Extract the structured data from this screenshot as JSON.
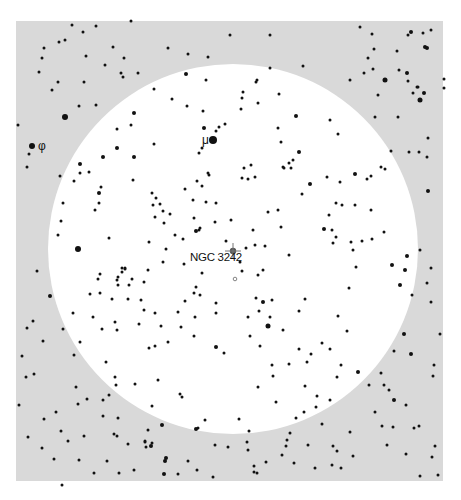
{
  "map": {
    "type": "finder-chart",
    "background_color": "#ffffff",
    "field_color": "#d9d9d9",
    "field_rect": {
      "x": 16,
      "y": 21,
      "w": 427,
      "h": 460
    },
    "fov_circle": {
      "cx": 233,
      "cy": 249,
      "r": 185,
      "color": "#ffffff"
    },
    "target": {
      "name": "NGC 3242",
      "x": 233,
      "y": 251,
      "label_x": 190,
      "label_y": 261
    },
    "labels": [
      {
        "text": "μ",
        "x": 202,
        "y": 144,
        "star_x": 213,
        "star_y": 140
      },
      {
        "text": "φ",
        "x": 38,
        "y": 150,
        "star_x": 32,
        "star_y": 146
      }
    ],
    "open_marker": {
      "x": 235,
      "y": 279
    }
  },
  "stars": [
    [
      213,
      140,
      4
    ],
    [
      32,
      146,
      3
    ],
    [
      78,
      249,
      3
    ],
    [
      233,
      251,
      0
    ],
    [
      121,
      73,
      1.5
    ],
    [
      138,
      73,
      1.5
    ],
    [
      58,
      82,
      1.5
    ],
    [
      84,
      82,
      1.5
    ],
    [
      105,
      65,
      1.5
    ],
    [
      65,
      117,
      3
    ],
    [
      79,
      106,
      1.5
    ],
    [
      96,
      105,
      1.5
    ],
    [
      131,
      125,
      1.5
    ],
    [
      18,
      125,
      1.5
    ],
    [
      29,
      154,
      1.5
    ],
    [
      27,
      167,
      1.5
    ],
    [
      60,
      176,
      1.5
    ],
    [
      80,
      173,
      1.5
    ],
    [
      123,
      77,
      1.5
    ],
    [
      168,
      48,
      1.5
    ],
    [
      188,
      54,
      1.5
    ],
    [
      208,
      57,
      1.5
    ],
    [
      186,
      74,
      2
    ],
    [
      206,
      80,
      1.5
    ],
    [
      154,
      89,
      1.5
    ],
    [
      172,
      99,
      1.5
    ],
    [
      187,
      106,
      1.5
    ],
    [
      203,
      111,
      1.5
    ],
    [
      202,
      148,
      1.5
    ],
    [
      199,
      153,
      1.5
    ],
    [
      216,
      131,
      1.5
    ],
    [
      204,
      128,
      2
    ],
    [
      219,
      127,
      1.5
    ],
    [
      225,
      124,
      1.5
    ],
    [
      134,
      113,
      2
    ],
    [
      117,
      129,
      1.5
    ],
    [
      154,
      144,
      1.5
    ],
    [
      117,
      148,
      2
    ],
    [
      134,
      157,
      2
    ],
    [
      103,
      157,
      2
    ],
    [
      80,
      164,
      2
    ],
    [
      89,
      172,
      1.5
    ],
    [
      74,
      181,
      1.5
    ],
    [
      101,
      187,
      1.5
    ],
    [
      99,
      193,
      2
    ],
    [
      95,
      210,
      1.5
    ],
    [
      99,
      203,
      1.5
    ],
    [
      133,
      180,
      1.5
    ],
    [
      152,
      193,
      1.5
    ],
    [
      153,
      205,
      1.5
    ],
    [
      156,
      198,
      1.5
    ],
    [
      160,
      204,
      1.5
    ],
    [
      185,
      189,
      1.5
    ],
    [
      193,
      200,
      1.5
    ],
    [
      197,
      181,
      1.5
    ],
    [
      208,
      173,
      1.5
    ],
    [
      209,
      175,
      1.5
    ],
    [
      243,
      92,
      1.5
    ],
    [
      257,
      80,
      1.5
    ],
    [
      256,
      82,
      1.5
    ],
    [
      242,
      98,
      1.5
    ],
    [
      279,
      94,
      1.5
    ],
    [
      303,
      66,
      1.5
    ],
    [
      270,
      68,
      1.5
    ],
    [
      296,
      116,
      2
    ],
    [
      241,
      109,
      1.5
    ],
    [
      258,
      103,
      1.5
    ],
    [
      278,
      128,
      1.5
    ],
    [
      299,
      152,
      2
    ],
    [
      330,
      120,
      1.5
    ],
    [
      338,
      134,
      1.5
    ],
    [
      281,
      142,
      1.5
    ],
    [
      293,
      160,
      1.5
    ],
    [
      283,
      167,
      1.5
    ],
    [
      284,
      168,
      1.5
    ],
    [
      291,
      168,
      1.5
    ],
    [
      251,
      165,
      1.5
    ],
    [
      255,
      177,
      1.5
    ],
    [
      248,
      179,
      1.5
    ],
    [
      244,
      168,
      1.5
    ],
    [
      242,
      178,
      1.5
    ],
    [
      289,
      163,
      1.5
    ],
    [
      310,
      184,
      2
    ],
    [
      327,
      177,
      1.5
    ],
    [
      340,
      182,
      1.5
    ],
    [
      302,
      194,
      1.5
    ],
    [
      336,
      203,
      1.5
    ],
    [
      342,
      205,
      1.5
    ],
    [
      355,
      174,
      2
    ],
    [
      355,
      205,
      1.5
    ],
    [
      367,
      179,
      1.5
    ],
    [
      371,
      210,
      1.5
    ],
    [
      371,
      176,
      1.5
    ],
    [
      385,
      80,
      2.5
    ],
    [
      350,
      80,
      1.5
    ],
    [
      364,
      73,
      1.5
    ],
    [
      399,
      70,
      1.5
    ],
    [
      407,
      73,
      2
    ],
    [
      408,
      81,
      1.5
    ],
    [
      413,
      93,
      1.5
    ],
    [
      417,
      87,
      1.5
    ],
    [
      420,
      100,
      2.5
    ],
    [
      418,
      87,
      1.5
    ],
    [
      424,
      93,
      2
    ],
    [
      444,
      88,
      1.5
    ],
    [
      444,
      79,
      1.5
    ],
    [
      398,
      117,
      1.5
    ],
    [
      378,
      95,
      1.5
    ],
    [
      375,
      117,
      1.5
    ],
    [
      391,
      151,
      1.5
    ],
    [
      409,
      152,
      1.5
    ],
    [
      419,
      152,
      1.5
    ],
    [
      427,
      157,
      1.5
    ],
    [
      428,
      191,
      2
    ],
    [
      385,
      169,
      1.5
    ],
    [
      381,
      167,
      1.5
    ],
    [
      270,
      35,
      1.5
    ],
    [
      230,
      35,
      1.5
    ],
    [
      360,
      27,
      1.5
    ],
    [
      411,
      32,
      2
    ],
    [
      408,
      35,
      1.5
    ],
    [
      425,
      47,
      2
    ],
    [
      427,
      48,
      2
    ],
    [
      423,
      33,
      1.5
    ],
    [
      372,
      34,
      1.5
    ],
    [
      131,
      21,
      1.5
    ],
    [
      96,
      26,
      1.5
    ],
    [
      83,
      32,
      1.5
    ],
    [
      65,
      40,
      1.5
    ],
    [
      59,
      42,
      1.5
    ],
    [
      44,
      48,
      1.5
    ],
    [
      86,
      56,
      1.5
    ],
    [
      124,
      58,
      1.5
    ],
    [
      113,
      47,
      1.5
    ],
    [
      72,
      25,
      1.5
    ],
    [
      42,
      58,
      1.5
    ],
    [
      374,
      49,
      1.5
    ],
    [
      397,
      51,
      1.5
    ],
    [
      431,
      30,
      1.5
    ],
    [
      368,
      58,
      1.5
    ],
    [
      373,
      69,
      1.5
    ],
    [
      39,
      72,
      1.5
    ],
    [
      52,
      90,
      1.5
    ],
    [
      428,
      138,
      1.5
    ],
    [
      196,
      231,
      2
    ],
    [
      200,
      228,
      1.5
    ],
    [
      215,
      222,
      1.5
    ],
    [
      242,
      271,
      1.5
    ],
    [
      265,
      246,
      1.5
    ],
    [
      255,
      245,
      1.5
    ],
    [
      246,
      248,
      1.5
    ],
    [
      268,
      212,
      1.5
    ],
    [
      278,
      210,
      1.5
    ],
    [
      289,
      255,
      1.5
    ],
    [
      281,
      227,
      1.5
    ],
    [
      258,
      275,
      1.5
    ],
    [
      263,
      270,
      1.5
    ],
    [
      240,
      262,
      1.5
    ],
    [
      226,
      241,
      1.5
    ],
    [
      216,
      203,
      1.5
    ],
    [
      206,
      202,
      1.5
    ],
    [
      202,
      186,
      1.5
    ],
    [
      163,
      211,
      1.5
    ],
    [
      170,
      214,
      1.5
    ],
    [
      184,
      264,
      1.5
    ],
    [
      163,
      262,
      1.5
    ],
    [
      125,
      268,
      1.5
    ],
    [
      148,
      270,
      1.5
    ],
    [
      149,
      242,
      1.5
    ],
    [
      155,
      217,
      1.5
    ],
    [
      164,
      223,
      1.5
    ],
    [
      175,
      235,
      1.5
    ],
    [
      166,
      249,
      1.5
    ],
    [
      183,
      239,
      1.5
    ],
    [
      199,
      230,
      1.5
    ],
    [
      202,
      273,
      1.5
    ],
    [
      194,
      218,
      1.5
    ],
    [
      231,
      220,
      1.5
    ],
    [
      253,
      230,
      1.5
    ],
    [
      324,
      229,
      2
    ],
    [
      332,
      230,
      1.5
    ],
    [
      336,
      237,
      1.5
    ],
    [
      329,
      215,
      1.5
    ],
    [
      333,
      243,
      1.5
    ],
    [
      351,
      242,
      1.5
    ],
    [
      353,
      250,
      1.5
    ],
    [
      362,
      241,
      1.5
    ],
    [
      372,
      239,
      1.5
    ],
    [
      356,
      267,
      1.5
    ],
    [
      384,
      232,
      1.5
    ],
    [
      392,
      265,
      2
    ],
    [
      420,
      250,
      1.5
    ],
    [
      407,
      256,
      2
    ],
    [
      405,
      270,
      2
    ],
    [
      400,
      285,
      2
    ],
    [
      412,
      295,
      1.5
    ],
    [
      431,
      268,
      1.5
    ],
    [
      427,
      283,
      1.5
    ],
    [
      431,
      302,
      1.5
    ],
    [
      63,
      203,
      1.5
    ],
    [
      61,
      221,
      1.5
    ],
    [
      58,
      235,
      1.5
    ],
    [
      109,
      238,
      1.5
    ],
    [
      100,
      274,
      1.5
    ],
    [
      98,
      279,
      1.5
    ],
    [
      118,
      277,
      1.5
    ],
    [
      122,
      268,
      1.5
    ],
    [
      125,
      269,
      1.5
    ],
    [
      117,
      280,
      1.5
    ],
    [
      118,
      285,
      1.5
    ],
    [
      129,
      285,
      1.5
    ],
    [
      132,
      279,
      1.5
    ],
    [
      141,
      300,
      1.5
    ],
    [
      144,
      282,
      1.5
    ],
    [
      144,
      310,
      1.5
    ],
    [
      115,
      322,
      1.5
    ],
    [
      117,
      330,
      1.5
    ],
    [
      93,
      317,
      1.5
    ],
    [
      102,
      329,
      1.5
    ],
    [
      100,
      293,
      1.5
    ],
    [
      112,
      299,
      1.5
    ],
    [
      90,
      294,
      1.5
    ],
    [
      122,
      272,
      1.5
    ],
    [
      128,
      299,
      1.5
    ],
    [
      139,
      324,
      1.5
    ],
    [
      155,
      313,
      1.5
    ],
    [
      161,
      326,
      1.5
    ],
    [
      155,
      346,
      1.5
    ],
    [
      168,
      342,
      1.5
    ],
    [
      178,
      312,
      1.5
    ],
    [
      181,
      327,
      1.5
    ],
    [
      194,
      336,
      1.5
    ],
    [
      195,
      317,
      1.5
    ],
    [
      216,
      303,
      1.5
    ],
    [
      216,
      313,
      1.5
    ],
    [
      216,
      347,
      2
    ],
    [
      224,
      353,
      1.5
    ],
    [
      196,
      287,
      1.5
    ],
    [
      200,
      295,
      1.5
    ],
    [
      185,
      301,
      1.5
    ],
    [
      194,
      293,
      1.5
    ],
    [
      256,
      298,
      1.5
    ],
    [
      259,
      311,
      1.5
    ],
    [
      270,
      317,
      1.5
    ],
    [
      272,
      300,
      1.5
    ],
    [
      263,
      302,
      2
    ],
    [
      268,
      326,
      2.5
    ],
    [
      248,
      317,
      1.5
    ],
    [
      250,
      336,
      1.5
    ],
    [
      283,
      330,
      1.5
    ],
    [
      305,
      299,
      1.5
    ],
    [
      299,
      311,
      1.5
    ],
    [
      349,
      288,
      1.5
    ],
    [
      338,
      316,
      1.5
    ],
    [
      347,
      331,
      1.5
    ],
    [
      322,
      343,
      1.5
    ],
    [
      330,
      349,
      1.5
    ],
    [
      299,
      349,
      1.5
    ],
    [
      307,
      362,
      1.5
    ],
    [
      311,
      354,
      1.5
    ],
    [
      260,
      346,
      1.5
    ],
    [
      272,
      365,
      1.5
    ],
    [
      289,
      364,
      1.5
    ],
    [
      341,
      365,
      1.5
    ],
    [
      358,
      372,
      2
    ],
    [
      369,
      385,
      1.5
    ],
    [
      50,
      296,
      2
    ],
    [
      43,
      341,
      1.5
    ],
    [
      33,
      321,
      1.5
    ],
    [
      37,
      271,
      1.5
    ],
    [
      27,
      328,
      1.5
    ],
    [
      63,
      329,
      1.5
    ],
    [
      73,
      313,
      1.5
    ],
    [
      80,
      342,
      1.5
    ],
    [
      22,
      356,
      1.5
    ],
    [
      34,
      374,
      1.5
    ],
    [
      19,
      405,
      1.5
    ],
    [
      28,
      437,
      1.5
    ],
    [
      44,
      419,
      1.5
    ],
    [
      56,
      412,
      1.5
    ],
    [
      61,
      431,
      1.5
    ],
    [
      76,
      387,
      1.5
    ],
    [
      78,
      404,
      1.5
    ],
    [
      26,
      377,
      1.5
    ],
    [
      394,
      351,
      1.5
    ],
    [
      381,
      373,
      1.5
    ],
    [
      384,
      385,
      1.5
    ],
    [
      389,
      390,
      1.5
    ],
    [
      394,
      400,
      2
    ],
    [
      375,
      412,
      1.5
    ],
    [
      406,
      405,
      1.5
    ],
    [
      419,
      426,
      1.5
    ],
    [
      414,
      428,
      1.5
    ],
    [
      382,
      426,
      1.5
    ],
    [
      387,
      445,
      1.5
    ],
    [
      406,
      454,
      1.5
    ],
    [
      432,
      457,
      1.5
    ],
    [
      420,
      476,
      1.5
    ],
    [
      438,
      475,
      1.5
    ],
    [
      435,
      446,
      1.5
    ],
    [
      433,
      376,
      1.5
    ],
    [
      440,
      334,
      1.5
    ],
    [
      411,
      354,
      2
    ],
    [
      434,
      365,
      1.5
    ],
    [
      404,
      334,
      2
    ],
    [
      393,
      427,
      1.5
    ],
    [
      74,
      355,
      1.5
    ],
    [
      106,
      362,
      1.5
    ],
    [
      115,
      377,
      1.5
    ],
    [
      116,
      385,
      1.5
    ],
    [
      149,
      348,
      1.5
    ],
    [
      152,
      406,
      1.5
    ],
    [
      158,
      380,
      1.5
    ],
    [
      135,
      384,
      1.5
    ],
    [
      109,
      395,
      1.5
    ],
    [
      103,
      400,
      1.5
    ],
    [
      87,
      399,
      1.5
    ],
    [
      103,
      416,
      1.5
    ],
    [
      118,
      418,
      1.5
    ],
    [
      114,
      434,
      1.5
    ],
    [
      152,
      443,
      1.5
    ],
    [
      146,
      447,
      1.5
    ],
    [
      162,
      425,
      2
    ],
    [
      117,
      436,
      1.5
    ],
    [
      84,
      436,
      1.5
    ],
    [
      148,
      430,
      1.5
    ],
    [
      145,
      442,
      1.5
    ],
    [
      68,
      441,
      1.5
    ],
    [
      42,
      448,
      1.5
    ],
    [
      79,
      460,
      1.5
    ],
    [
      62,
      485,
      1.5
    ],
    [
      54,
      459,
      1.5
    ],
    [
      94,
      473,
      1.5
    ],
    [
      107,
      461,
      1.5
    ],
    [
      119,
      473,
      1.5
    ],
    [
      128,
      444,
      1.5
    ],
    [
      134,
      470,
      1.5
    ],
    [
      145,
      441,
      1.5
    ],
    [
      151,
      446,
      2
    ],
    [
      165,
      461,
      2
    ],
    [
      180,
      394,
      1.5
    ],
    [
      182,
      397,
      1.5
    ],
    [
      196,
      429,
      2
    ],
    [
      198,
      428,
      1.5
    ],
    [
      205,
      420,
      1.5
    ],
    [
      215,
      445,
      1.5
    ],
    [
      239,
      419,
      1.5
    ],
    [
      247,
      442,
      1.5
    ],
    [
      249,
      431,
      1.5
    ],
    [
      248,
      450,
      1.5
    ],
    [
      287,
      440,
      1.5
    ],
    [
      286,
      446,
      1.5
    ],
    [
      228,
      447,
      1.5
    ],
    [
      254,
      466,
      1.5
    ],
    [
      266,
      462,
      1.5
    ],
    [
      282,
      455,
      1.5
    ],
    [
      290,
      433,
      1.5
    ],
    [
      294,
      463,
      1.5
    ],
    [
      308,
      445,
      1.5
    ],
    [
      315,
      468,
      1.5
    ],
    [
      333,
      446,
      1.5
    ],
    [
      337,
      451,
      1.5
    ],
    [
      332,
      465,
      1.5
    ],
    [
      341,
      468,
      1.5
    ],
    [
      353,
      456,
      1.5
    ],
    [
      350,
      432,
      1.5
    ],
    [
      322,
      424,
      1.5
    ],
    [
      166,
      458,
      2
    ],
    [
      164,
      474,
      2
    ],
    [
      178,
      474,
      1.5
    ],
    [
      188,
      461,
      1.5
    ],
    [
      197,
      470,
      1.5
    ],
    [
      213,
      477,
      1.5
    ],
    [
      257,
      473,
      1.5
    ],
    [
      254,
      472,
      1.5
    ],
    [
      316,
      407,
      1.5
    ],
    [
      304,
      412,
      1.5
    ],
    [
      296,
      418,
      1.5
    ],
    [
      276,
      402,
      1.5
    ],
    [
      258,
      387,
      1.5
    ],
    [
      273,
      376,
      1.5
    ],
    [
      317,
      396,
      1.5
    ],
    [
      305,
      386,
      1.5
    ],
    [
      330,
      400,
      1.5
    ],
    [
      337,
      377,
      1.5
    ]
  ]
}
